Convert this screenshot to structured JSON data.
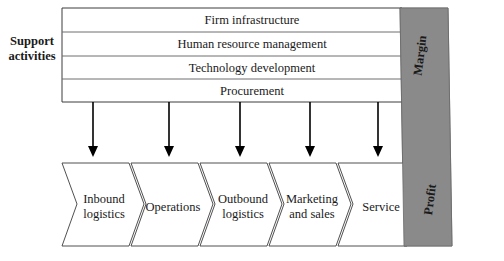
{
  "diagram": {
    "side_labels": {
      "support": [
        "Support",
        "activities"
      ]
    },
    "support_activities": [
      {
        "label": "Firm infrastructure"
      },
      {
        "label": "Human resource management"
      },
      {
        "label": "Technology development"
      },
      {
        "label": "Procurement"
      }
    ],
    "primary_activities": [
      {
        "lines": [
          "Inbound",
          "logistics"
        ]
      },
      {
        "lines": [
          "Operations"
        ]
      },
      {
        "lines": [
          "Outbound",
          "logistics"
        ]
      },
      {
        "lines": [
          "Marketing",
          "and sales"
        ]
      },
      {
        "lines": [
          "Service"
        ]
      }
    ],
    "bands": {
      "margin_label": "Margin",
      "profit_label": "Profit"
    },
    "colors": {
      "band_fill": "#8a8a8a",
      "band_stroke": "#6a6a6a",
      "outline": "#3c3c3c",
      "divider": "#6e6e6e",
      "arrow": "#000000",
      "text": "#1a1a1a",
      "background": "#ffffff"
    }
  }
}
